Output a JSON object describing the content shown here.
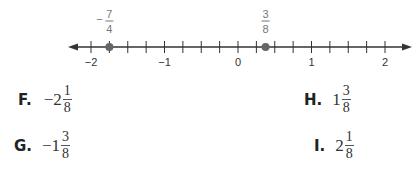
{
  "number_line": {
    "min": -2,
    "max": 2,
    "tick_step": 0.25,
    "labels": [
      "-2",
      "-1",
      "0",
      "1",
      "2"
    ],
    "label_values": [
      -2,
      -1,
      0,
      1,
      2
    ],
    "points": [
      {
        "value": -1.75,
        "label_sign": "−",
        "numerator": "7",
        "denominator": "4"
      },
      {
        "value": 0.375,
        "label_sign": "",
        "numerator": "3",
        "denominator": "8"
      }
    ],
    "color_line": "#333333",
    "color_point": "#666666"
  },
  "choices": [
    {
      "letter": "F.",
      "sign": "−",
      "whole": "2",
      "numerator": "1",
      "denominator": "8"
    },
    {
      "letter": "G.",
      "sign": "−",
      "whole": "1",
      "numerator": "3",
      "denominator": "8"
    },
    {
      "letter": "H.",
      "sign": "",
      "whole": "1",
      "numerator": "3",
      "denominator": "8"
    },
    {
      "letter": "I.",
      "sign": "",
      "whole": "2",
      "numerator": "1",
      "denominator": "8"
    }
  ]
}
